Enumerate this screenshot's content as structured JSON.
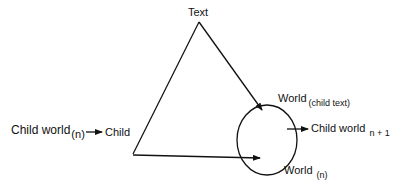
{
  "diagram": {
    "nodes": {
      "text": {
        "label": "Text"
      },
      "child_world_n": {
        "label": "Child world",
        "subscript": "(n)"
      },
      "child": {
        "label": "Child"
      },
      "world_child_text": {
        "label": "World",
        "subscript": "(child text)"
      },
      "child_world_n1": {
        "label": "Child world",
        "subscript": "n + 1"
      },
      "world_n": {
        "label": "World",
        "subscript": "(n)"
      }
    },
    "edges": [
      {
        "from": "child_world_n",
        "to": "child",
        "type": "arrow"
      },
      {
        "from": "text",
        "to": "child",
        "type": "line"
      },
      {
        "from": "text",
        "to": "world_ellipse",
        "type": "arrow"
      },
      {
        "from": "child",
        "to": "world_ellipse",
        "type": "arrow"
      },
      {
        "from": "world_ellipse",
        "to": "child_world_n1",
        "type": "arrow"
      }
    ],
    "colors": {
      "stroke": "#111111",
      "background": "#ffffff"
    }
  }
}
